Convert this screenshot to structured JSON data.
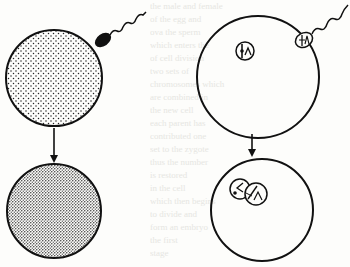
{
  "diagram": {
    "colors": {
      "ink": "#111111",
      "paper": "#fdfdfb",
      "bleed_text": "#e6e6e2"
    },
    "panels": [
      {
        "id": "top-left",
        "label": "Stippled egg with approaching sperm",
        "egg": {
          "cx": 54,
          "cy": 78,
          "r": 48,
          "fill": "sparse-stipple"
        },
        "sperm": {
          "head": [
            103,
            40
          ],
          "tail_end": [
            146,
            12
          ]
        }
      },
      {
        "id": "bottom-left",
        "label": "Egg after fertilization, densely stippled",
        "egg": {
          "cx": 54,
          "cy": 211,
          "r": 47,
          "fill": "dense-stipple"
        }
      },
      {
        "id": "top-right",
        "label": "Egg with haploid nucleus and sperm carrying chromosomes",
        "egg": {
          "cx": 258,
          "cy": 77,
          "r": 61
        },
        "nucleus": {
          "cx": 245,
          "cy": 51,
          "r": 9
        },
        "sperm": {
          "head": [
            304,
            40
          ],
          "tail_end": [
            348,
            5
          ]
        }
      },
      {
        "id": "bottom-right",
        "label": "Fused male and female pronuclei",
        "egg": {
          "cx": 262,
          "cy": 210,
          "r": 51
        },
        "pronuclei": [
          {
            "cx": 240,
            "cy": 189,
            "r": 10
          },
          {
            "cx": 256,
            "cy": 194,
            "r": 11
          }
        ]
      }
    ],
    "arrows": [
      {
        "id": "left-arrow",
        "x": 54,
        "y1": 128,
        "y2": 161
      },
      {
        "id": "right-arrow",
        "x": 252,
        "y1": 134,
        "y2": 156
      }
    ],
    "bleed_through_lines": [
      "the male and female",
      "of the egg and",
      "ova the sperm",
      "which enters the",
      "of cell division",
      "two sets of",
      "chromosomes which",
      "are combined in",
      "the new cell",
      "each parent has",
      "contributed one",
      "set to the zygote",
      "thus the number",
      "is restored",
      "in the cell",
      "which then begins",
      "to divide and",
      "form an embryo",
      "the first",
      "stage"
    ]
  }
}
